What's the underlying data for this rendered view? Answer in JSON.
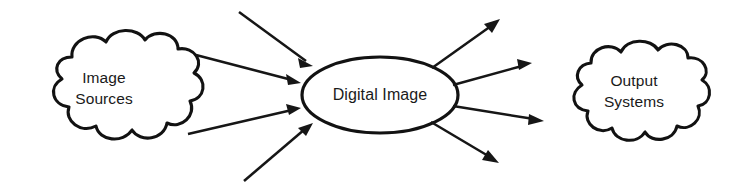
{
  "diagram": {
    "background_color": "#ffffff",
    "line_color": "#161616",
    "text_color": "#1a1a1a",
    "nodes": {
      "source_cloud": {
        "shape": "cloud",
        "label_line1": "Image",
        "label_line2": "Sources"
      },
      "center_ellipse": {
        "shape": "ellipse",
        "label": "Digital Image"
      },
      "output_cloud": {
        "shape": "cloud",
        "label_line1": "Output",
        "label_line2": "Systems"
      }
    },
    "edges": {
      "incoming_count": 4,
      "outgoing_count": 4,
      "incoming_label": "Image Sources to Digital Image",
      "outgoing_label": "Digital Image to Output Systems"
    }
  }
}
